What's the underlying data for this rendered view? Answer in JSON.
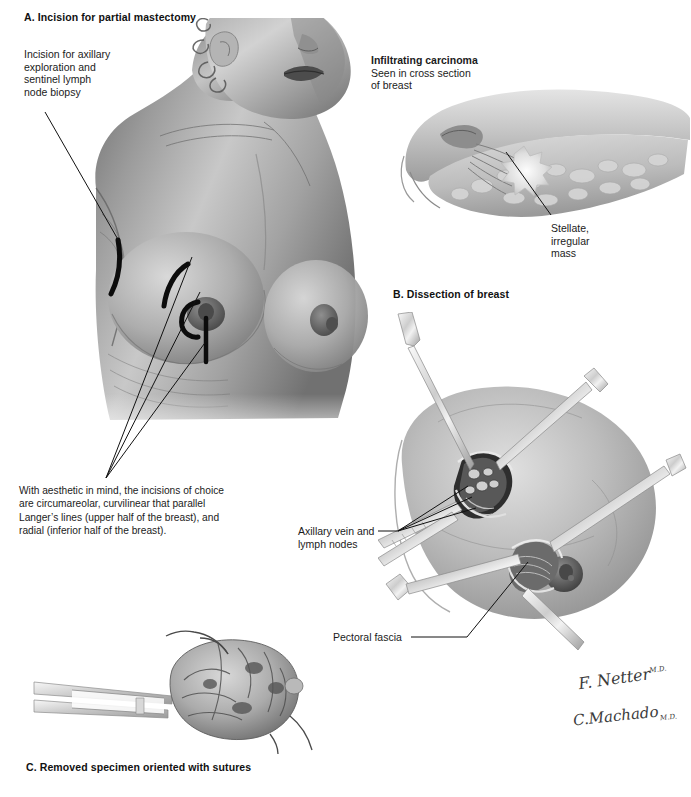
{
  "plate": {
    "title_a": "A. Incision for partial mastectomy",
    "title_b": "B. Dissection of breast",
    "title_c": "C. Removed specimen oriented with sutures",
    "background_color": "#ffffff",
    "ink_color": "#1a1a1a"
  },
  "panel_a": {
    "label_axillary": {
      "line1": "Incision for axillary",
      "line2": "exploration and",
      "line3": "sentinel  lymph",
      "line4": "node biopsy"
    },
    "caption": {
      "line1": "With aesthetic in mind, the incisions of choice",
      "line2": "are circumareolar, curvilinear that  parallel",
      "line3": "Langer’s lines (upper  half of the breast), and",
      "line4": "radial (inferior half of the breast)."
    },
    "incision_marks": [
      "axillary-incision-mark",
      "curvilinear-incision-mark",
      "circumareolar-incision-mark",
      "radial-incision-mark"
    ]
  },
  "inset_carcinoma": {
    "title": "Infiltrating carcinoma",
    "subtitle_line1": "Seen in cross section",
    "subtitle_line2": "of breast",
    "mass_label": {
      "line1": "Stellate,",
      "line2": "irregular",
      "line3": "mass"
    }
  },
  "panel_b": {
    "label_axillary_vein": {
      "line1": "Axillary vein and",
      "line2": "lymph nodes"
    },
    "label_pectoral_fascia": "Pectoral fascia"
  },
  "panel_c": {
    "caption": "C. Removed specimen oriented with sutures"
  },
  "signatures": {
    "artist_primary": "F. Netter",
    "artist_primary_suffix": "M.D.",
    "artist_secondary": "C.Machado",
    "artist_secondary_suffix": "M.D."
  }
}
